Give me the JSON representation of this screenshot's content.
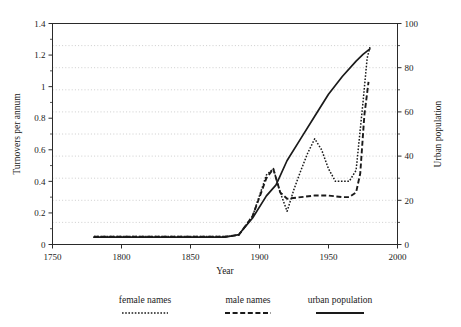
{
  "chart_data": {
    "type": "line",
    "title": "",
    "xlabel": "Year",
    "ylabel": "Turnovers per annum",
    "y2label": "Urban population",
    "xlim": [
      1750,
      2000
    ],
    "ylim": [
      0,
      1.4
    ],
    "y2lim": [
      0,
      100
    ],
    "grid": true,
    "grid_axis": "y2",
    "grid_interval": 10,
    "legend_position": "bottom",
    "xticks": [
      1750,
      1800,
      1850,
      1900,
      1950,
      2000
    ],
    "xtick_labels": [
      "1750",
      "1800",
      "1850",
      "1900",
      "1950",
      "2000"
    ],
    "yticks": [
      0,
      0.2,
      0.4,
      0.6,
      0.8,
      1,
      1.2,
      1.4
    ],
    "ytick_labels": [
      "0",
      "0.2",
      "0.4",
      "0.6",
      "0.8",
      "1",
      "1.2",
      "1.4"
    ],
    "y2ticks": [
      0,
      20,
      40,
      60,
      80,
      100
    ],
    "y2tick_labels": [
      "0",
      "20",
      "40",
      "60",
      "80",
      "100"
    ],
    "series": [
      {
        "name": "female names",
        "axis": "left",
        "style": "dotted",
        "x": [
          1780,
          1800,
          1820,
          1840,
          1860,
          1875,
          1885,
          1895,
          1905,
          1910,
          1915,
          1920,
          1925,
          1930,
          1935,
          1940,
          1945,
          1950,
          1955,
          1960,
          1965,
          1970,
          1975,
          1978,
          1980
        ],
        "y": [
          0.05,
          0.05,
          0.05,
          0.05,
          0.05,
          0.05,
          0.06,
          0.18,
          0.44,
          0.48,
          0.33,
          0.21,
          0.35,
          0.47,
          0.58,
          0.67,
          0.6,
          0.48,
          0.4,
          0.4,
          0.4,
          0.47,
          0.9,
          1.18,
          1.25
        ]
      },
      {
        "name": "male names",
        "axis": "left",
        "style": "dashed",
        "x": [
          1780,
          1800,
          1820,
          1840,
          1860,
          1875,
          1885,
          1895,
          1905,
          1910,
          1915,
          1920,
          1930,
          1940,
          1950,
          1960,
          1965,
          1970,
          1973,
          1976,
          1979
        ],
        "y": [
          0.05,
          0.05,
          0.05,
          0.05,
          0.05,
          0.05,
          0.06,
          0.18,
          0.42,
          0.48,
          0.33,
          0.29,
          0.3,
          0.31,
          0.31,
          0.3,
          0.3,
          0.33,
          0.45,
          0.82,
          1.03
        ]
      },
      {
        "name": "urban population",
        "axis": "right",
        "style": "solid",
        "x": [
          1780,
          1800,
          1820,
          1840,
          1860,
          1875,
          1885,
          1895,
          1905,
          1912,
          1920,
          1930,
          1940,
          1950,
          1960,
          1970,
          1975,
          1980
        ],
        "y": [
          3.3,
          3.3,
          3.3,
          3.3,
          3.3,
          3.3,
          4.5,
          12,
          22,
          27,
          38,
          48,
          58,
          68,
          76,
          83,
          86,
          88.5
        ]
      }
    ]
  },
  "legend": {
    "items": [
      {
        "label": "female names",
        "style": "dotted"
      },
      {
        "label": "male names",
        "style": "dashed"
      },
      {
        "label": "urban population",
        "style": "solid"
      }
    ]
  }
}
